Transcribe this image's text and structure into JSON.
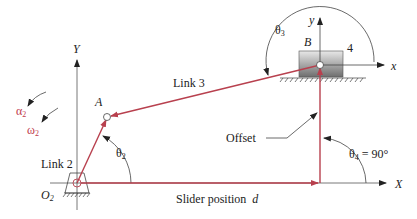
{
  "diagram": {
    "type": "slider-crank mechanism (offset)",
    "colors": {
      "link": "#b8404e",
      "axis": "#444444",
      "accent_red": "#c0394a",
      "block_dark": "#6b6b6b",
      "block_light": "#e6e6e6"
    },
    "axes": {
      "global_x_label": "X",
      "global_y_label": "Y",
      "local_x_label": "x",
      "local_y_label": "y"
    },
    "points": {
      "O2": {
        "label_main": "O",
        "label_sub": "2"
      },
      "A": {
        "label": "A"
      },
      "B": {
        "label": "B"
      }
    },
    "links": {
      "link2": "Link 2",
      "link3": "Link 3",
      "link4": "4"
    },
    "angles": {
      "theta2": {
        "main": "θ",
        "sub": "2"
      },
      "theta3": {
        "main": "θ",
        "sub": "3"
      },
      "theta4": {
        "main": "θ",
        "sub": "4",
        "value": " = 90°"
      }
    },
    "kinematics": {
      "alpha2": {
        "main": "α",
        "sub": "2"
      },
      "omega2": {
        "main": "ω",
        "sub": "2"
      }
    },
    "annotations": {
      "offset": "Offset",
      "slider_position": "Slider position",
      "slider_var": "d"
    }
  }
}
